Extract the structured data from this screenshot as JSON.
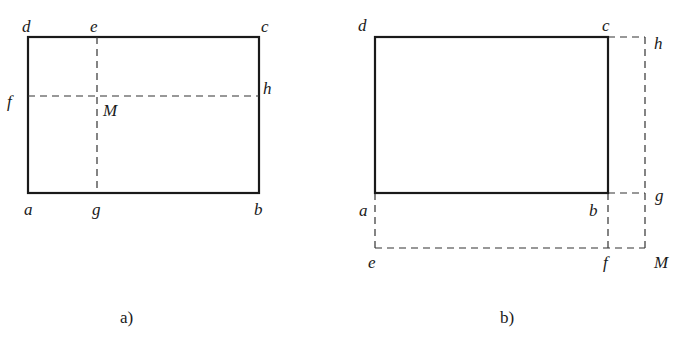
{
  "figure_a": {
    "caption": "a)",
    "rectangle": {
      "x1": 28,
      "y1": 37,
      "x2": 259,
      "y2": 193
    },
    "dashed_lines": [
      {
        "name": "e-g",
        "x1": 97,
        "y1": 37,
        "x2": 97,
        "y2": 193
      },
      {
        "name": "f-h",
        "x1": 28,
        "y1": 96,
        "x2": 259,
        "y2": 96
      }
    ],
    "labels": {
      "d": "d",
      "e": "e",
      "c": "c",
      "f": "f",
      "h": "h",
      "M": "M",
      "a": "a",
      "g": "g",
      "b": "b"
    }
  },
  "figure_b": {
    "caption": "b)",
    "rectangle": {
      "x1": 375,
      "y1": 37,
      "x2": 608,
      "y2": 193
    },
    "dashed_lines": [
      {
        "name": "c-h",
        "x1": 608,
        "y1": 37,
        "x2": 645,
        "y2": 37
      },
      {
        "name": "h-M",
        "x1": 645,
        "y1": 37,
        "x2": 645,
        "y2": 248
      },
      {
        "name": "b-g",
        "x1": 608,
        "y1": 193,
        "x2": 645,
        "y2": 193
      },
      {
        "name": "a-e",
        "x1": 375,
        "y1": 193,
        "x2": 375,
        "y2": 248
      },
      {
        "name": "e-M",
        "x1": 375,
        "y1": 248,
        "x2": 645,
        "y2": 248
      },
      {
        "name": "b-f",
        "x1": 608,
        "y1": 193,
        "x2": 608,
        "y2": 248
      }
    ],
    "labels": {
      "d": "d",
      "c": "c",
      "h": "h",
      "g": "g",
      "a": "a",
      "b": "b",
      "e": "e",
      "f": "f",
      "M": "M"
    }
  },
  "colors": {
    "line": "#1a1a1a",
    "dash": "#333333",
    "background": "#ffffff"
  }
}
